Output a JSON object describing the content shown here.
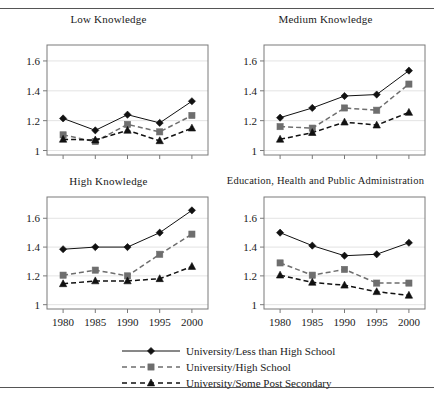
{
  "chart_data": [
    {
      "type": "line",
      "title": "Low Knowledge",
      "xlabel": "",
      "ylabel": "",
      "x": [
        1980,
        1985,
        1990,
        1995,
        2000
      ],
      "categories": [
        "1980",
        "1985",
        "1990",
        "1995",
        "2000"
      ],
      "xtick_labels": [
        "",
        "",
        "",
        "",
        ""
      ],
      "ytick_labels": [
        "1",
        "1.2",
        "1.4",
        "1.6"
      ],
      "yticks": [
        1,
        1.2,
        1.4,
        1.6
      ],
      "ylim": [
        0.97,
        1.68
      ],
      "xlim": [
        1977.5,
        2002.5
      ],
      "grid": true,
      "legend_position": "below-figure",
      "series": [
        {
          "name": "University/Less than High School",
          "values": [
            1.215,
            1.135,
            1.24,
            1.185,
            1.33
          ],
          "marker": "diamond",
          "line": "solid",
          "color": "#111111"
        },
        {
          "name": "University/High School",
          "values": [
            1.105,
            1.06,
            1.175,
            1.125,
            1.235
          ],
          "marker": "square",
          "line": "dashed",
          "color": "#6e6e6e"
        },
        {
          "name": "University/Some Post Secondary",
          "values": [
            1.075,
            1.07,
            1.135,
            1.065,
            1.15
          ],
          "marker": "triangle",
          "line": "dashed",
          "color": "#111111"
        }
      ]
    },
    {
      "type": "line",
      "title": "Medium Knowledge",
      "xlabel": "",
      "ylabel": "",
      "x": [
        1980,
        1985,
        1990,
        1995,
        2000
      ],
      "categories": [
        "1980",
        "1985",
        "1990",
        "1995",
        "2000"
      ],
      "xtick_labels": [
        "",
        "",
        "",
        "",
        ""
      ],
      "ytick_labels": [
        "1",
        "1.2",
        "1.4",
        "1.6"
      ],
      "yticks": [
        1,
        1.2,
        1.4,
        1.6
      ],
      "ylim": [
        0.97,
        1.68
      ],
      "xlim": [
        1977.5,
        2002.5
      ],
      "grid": true,
      "legend_position": "below-figure",
      "series": [
        {
          "name": "University/Less than High School",
          "values": [
            1.22,
            1.285,
            1.365,
            1.375,
            1.535
          ],
          "marker": "diamond",
          "line": "solid",
          "color": "#111111"
        },
        {
          "name": "University/High School",
          "values": [
            1.16,
            1.15,
            1.285,
            1.27,
            1.445
          ],
          "marker": "square",
          "line": "dashed",
          "color": "#6e6e6e"
        },
        {
          "name": "University/Some Post Secondary",
          "values": [
            1.075,
            1.12,
            1.19,
            1.17,
            1.255
          ],
          "marker": "triangle",
          "line": "dashed",
          "color": "#111111"
        }
      ]
    },
    {
      "type": "line",
      "title": "High Knowledge",
      "xlabel": "",
      "ylabel": "",
      "x": [
        1980,
        1985,
        1990,
        1995,
        2000
      ],
      "categories": [
        "1980",
        "1985",
        "1990",
        "1995",
        "2000"
      ],
      "xtick_labels": [
        "1980",
        "1985",
        "1990",
        "1995",
        "2000"
      ],
      "ytick_labels": [
        "1",
        "1.2",
        "1.4",
        "1.6"
      ],
      "yticks": [
        1,
        1.2,
        1.4,
        1.6
      ],
      "ylim": [
        0.97,
        1.72
      ],
      "xlim": [
        1977.5,
        2002.5
      ],
      "grid": true,
      "legend_position": "below-figure",
      "series": [
        {
          "name": "University/Less than High School",
          "values": [
            1.385,
            1.4,
            1.4,
            1.5,
            1.655
          ],
          "marker": "diamond",
          "line": "solid",
          "color": "#111111"
        },
        {
          "name": "University/High School",
          "values": [
            1.205,
            1.24,
            1.2,
            1.35,
            1.49
          ],
          "marker": "square",
          "line": "dashed",
          "color": "#6e6e6e"
        },
        {
          "name": "University/Some Post Secondary",
          "values": [
            1.145,
            1.165,
            1.165,
            1.18,
            1.265
          ],
          "marker": "triangle",
          "line": "dashed",
          "color": "#111111"
        }
      ]
    },
    {
      "type": "line",
      "title": "Education, Health and Public Administration",
      "xlabel": "",
      "ylabel": "",
      "x": [
        1980,
        1985,
        1990,
        1995,
        2000
      ],
      "categories": [
        "1980",
        "1985",
        "1990",
        "1995",
        "2000"
      ],
      "xtick_labels": [
        "1980",
        "1985",
        "1990",
        "1995",
        "2000"
      ],
      "ytick_labels": [
        "1",
        "1.2",
        "1.4",
        "1.6"
      ],
      "yticks": [
        1,
        1.2,
        1.4,
        1.6
      ],
      "ylim": [
        0.97,
        1.72
      ],
      "xlim": [
        1977.5,
        2002.5
      ],
      "grid": true,
      "legend_position": "below-figure",
      "series": [
        {
          "name": "University/Less than High School",
          "values": [
            1.5,
            1.41,
            1.34,
            1.35,
            1.43
          ],
          "marker": "diamond",
          "line": "solid",
          "color": "#111111"
        },
        {
          "name": "University/High School",
          "values": [
            1.29,
            1.205,
            1.245,
            1.15,
            1.15
          ],
          "marker": "square",
          "line": "dashed",
          "color": "#6e6e6e"
        },
        {
          "name": "University/Some Post Secondary",
          "values": [
            1.205,
            1.155,
            1.135,
            1.09,
            1.065
          ],
          "marker": "triangle",
          "line": "dashed",
          "color": "#111111"
        }
      ]
    }
  ],
  "legend": {
    "items": [
      {
        "label": "University/Less than High School",
        "marker": "diamond",
        "line": "solid"
      },
      {
        "label": "University/High School",
        "marker": "square",
        "line": "dashed"
      },
      {
        "label": "University/Some Post Secondary",
        "marker": "triangle",
        "line": "dashed"
      }
    ]
  },
  "style": {
    "series_colors": [
      "#111111",
      "#6e6e6e",
      "#111111"
    ],
    "axis_color": "#7a7a7a",
    "grid_color": "#dcdcdc",
    "text_color": "#1a1a1a",
    "rule_color": "#555555"
  }
}
